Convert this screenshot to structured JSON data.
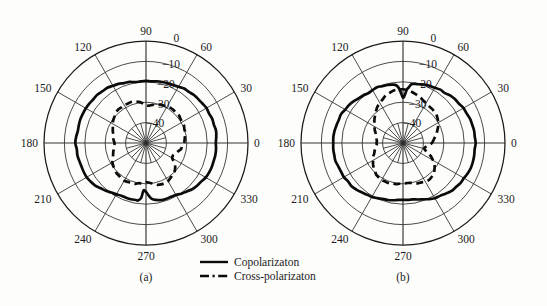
{
  "figure": {
    "background": "#fdfdfb",
    "ink": "#0b0b0b",
    "panels": [
      {
        "id": "a",
        "label": "(a)",
        "cx": 146,
        "cy": 143,
        "r": 102
      },
      {
        "id": "b",
        "label": "(b)",
        "cx": 403,
        "cy": 143,
        "r": 102
      }
    ]
  },
  "legend": {
    "items": [
      {
        "label": "Copolarizaton",
        "style": "solid"
      },
      {
        "label": "Cross-polarizaton",
        "style": "dashed"
      }
    ]
  },
  "chart_data": {
    "type": "line",
    "subtype": "polar-radiation-pattern",
    "title": "",
    "xlabel": "",
    "ylabel": "",
    "grid": true,
    "legend_position": "bottom-center",
    "angular_axis": {
      "unit": "degrees",
      "direction": "counterclockwise",
      "zero_at": "east",
      "tick_labels": [
        "0",
        "30",
        "60",
        "90",
        "120",
        "150",
        "180",
        "210",
        "240",
        "270",
        "300",
        "330"
      ],
      "tick_values": [
        0,
        30,
        60,
        90,
        120,
        150,
        180,
        210,
        240,
        270,
        300,
        330
      ]
    },
    "radial_axis": {
      "unit": "dB",
      "rlim": [
        -50,
        0
      ],
      "tick_labels": [
        "0",
        "-10",
        "-20",
        "-30",
        "-40"
      ],
      "tick_values": [
        0,
        -10,
        -20,
        -30,
        -40
      ],
      "label_angle_deg": 75,
      "n_rings": 5
    },
    "panels": [
      {
        "name": "(a)",
        "series": [
          {
            "name": "Copolarizaton",
            "style": "solid",
            "angles": [
              0,
              5,
              10,
              15,
              20,
              25,
              30,
              35,
              40,
              45,
              50,
              55,
              60,
              65,
              70,
              75,
              80,
              85,
              90,
              95,
              100,
              105,
              110,
              115,
              120,
              125,
              130,
              135,
              140,
              145,
              150,
              155,
              160,
              165,
              170,
              175,
              180,
              185,
              190,
              195,
              200,
              205,
              210,
              215,
              220,
              225,
              230,
              235,
              240,
              245,
              250,
              255,
              260,
              262,
              265,
              267,
              270,
              273,
              276,
              280,
              285,
              290,
              295,
              300,
              305,
              310,
              315,
              320,
              325,
              330,
              335,
              340,
              345,
              350,
              355
            ],
            "values": [
              -15.5,
              -15.4,
              -15.4,
              -15.5,
              -15.6,
              -15.8,
              -16.0,
              -16.3,
              -16.6,
              -16.9,
              -17.2,
              -17.6,
              -18.0,
              -18.4,
              -18.8,
              -19.1,
              -19.4,
              -19.6,
              -19.7,
              -19.8,
              -19.6,
              -19.2,
              -18.6,
              -18.0,
              -17.5,
              -17.1,
              -16.8,
              -16.6,
              -16.4,
              -16.3,
              -16.2,
              -16.1,
              -16.0,
              -15.9,
              -15.8,
              -15.7,
              -15.6,
              -15.7,
              -15.9,
              -16.2,
              -16.4,
              -16.4,
              -16.3,
              -16.8,
              -17.6,
              -18.6,
              -19.6,
              -20.4,
              -21.0,
              -21.4,
              -21.6,
              -21.7,
              -21.7,
              -21.6,
              -23.0,
              -26.5,
              -26.0,
              -24.0,
              -22.4,
              -21.6,
              -21.2,
              -21.0,
              -20.8,
              -20.4,
              -19.8,
              -19.0,
              -18.2,
              -17.5,
              -16.9,
              -16.4,
              -16.1,
              -15.9,
              -15.7,
              -15.6,
              -15.5
            ]
          },
          {
            "name": "Cross-polarizaton",
            "style": "dashed",
            "angles": [
              0,
              5,
              10,
              15,
              20,
              25,
              30,
              35,
              40,
              45,
              50,
              55,
              60,
              65,
              70,
              75,
              80,
              85,
              90,
              95,
              100,
              105,
              110,
              115,
              120,
              125,
              130,
              135,
              140,
              145,
              150,
              155,
              160,
              165,
              170,
              175,
              180,
              185,
              190,
              195,
              200,
              205,
              210,
              215,
              220,
              225,
              230,
              235,
              240,
              245,
              250,
              255,
              260,
              265,
              270,
              275,
              280,
              285,
              290,
              295,
              300,
              305,
              310,
              315,
              320,
              325,
              330,
              335,
              340,
              345,
              350,
              355
            ],
            "values": [
              -31.5,
              -31.0,
              -30.6,
              -30.2,
              -29.9,
              -29.6,
              -29.4,
              -29.2,
              -29.0,
              -28.9,
              -28.9,
              -29.0,
              -29.2,
              -29.5,
              -30.0,
              -30.6,
              -31.2,
              -31.8,
              -31.5,
              -30.6,
              -29.7,
              -29.1,
              -28.8,
              -28.6,
              -28.5,
              -28.6,
              -28.8,
              -29.2,
              -29.8,
              -30.5,
              -31.3,
              -32.1,
              -32.8,
              -33.4,
              -33.9,
              -34.2,
              -34.4,
              -34.3,
              -34.0,
              -33.5,
              -32.8,
              -32.0,
              -31.2,
              -30.5,
              -29.9,
              -29.4,
              -29.1,
              -28.9,
              -28.8,
              -28.9,
              -29.1,
              -29.4,
              -29.8,
              -30.3,
              -30.8,
              -30.4,
              -29.6,
              -28.9,
              -28.5,
              -28.4,
              -28.6,
              -29.0,
              -29.6,
              -30.4,
              -31.4,
              -33.0,
              -35.0,
              -35.6,
              -34.6,
              -33.6,
              -32.8,
              -32.1
            ]
          }
        ]
      },
      {
        "name": "(b)",
        "series": [
          {
            "name": "Copolarizaton",
            "style": "solid",
            "angles": [
              0,
              5,
              10,
              15,
              20,
              25,
              30,
              35,
              40,
              45,
              50,
              55,
              60,
              65,
              70,
              75,
              78,
              80,
              82,
              84,
              86,
              88,
              90,
              92,
              94,
              96,
              98,
              100,
              105,
              110,
              115,
              120,
              125,
              130,
              135,
              140,
              145,
              150,
              155,
              160,
              165,
              170,
              175,
              180,
              185,
              190,
              195,
              200,
              205,
              210,
              215,
              220,
              225,
              230,
              235,
              240,
              245,
              250,
              255,
              260,
              265,
              270,
              275,
              280,
              285,
              290,
              295,
              300,
              305,
              310,
              315,
              320,
              325,
              330,
              335,
              340,
              345,
              350,
              355
            ],
            "values": [
              -14.6,
              -14.6,
              -14.7,
              -14.9,
              -15.2,
              -15.5,
              -15.9,
              -16.3,
              -16.8,
              -17.3,
              -17.8,
              -18.3,
              -18.8,
              -19.2,
              -19.6,
              -20.0,
              -20.3,
              -20.6,
              -21.2,
              -22.3,
              -24.0,
              -26.4,
              -27.6,
              -25.6,
              -23.4,
              -22.0,
              -21.2,
              -20.8,
              -20.4,
              -20.2,
              -20.1,
              -20.1,
              -20.0,
              -19.6,
              -19.0,
              -18.4,
              -17.8,
              -17.2,
              -16.7,
              -16.3,
              -16.0,
              -15.8,
              -15.7,
              -15.6,
              -15.7,
              -15.8,
              -16.0,
              -16.2,
              -16.4,
              -16.6,
              -16.9,
              -17.3,
              -17.8,
              -18.4,
              -19.0,
              -19.6,
              -20.2,
              -20.8,
              -21.3,
              -21.7,
              -22.0,
              -22.1,
              -22.0,
              -21.7,
              -21.2,
              -20.5,
              -19.7,
              -18.9,
              -18.1,
              -17.4,
              -16.8,
              -16.2,
              -15.7,
              -15.3,
              -15.0,
              -14.8,
              -14.7,
              -14.6,
              -14.6
            ]
          },
          {
            "name": "Cross-polarizaton",
            "style": "dashed",
            "angles": [
              0,
              5,
              10,
              15,
              20,
              25,
              30,
              35,
              40,
              45,
              50,
              55,
              60,
              65,
              70,
              75,
              80,
              85,
              90,
              95,
              100,
              105,
              110,
              115,
              120,
              125,
              130,
              135,
              140,
              145,
              150,
              155,
              160,
              165,
              170,
              175,
              180,
              185,
              190,
              195,
              200,
              205,
              210,
              215,
              220,
              225,
              230,
              235,
              240,
              245,
              250,
              255,
              260,
              265,
              270,
              275,
              280,
              285,
              290,
              295,
              300,
              305,
              310,
              315,
              320,
              325,
              330,
              335,
              340,
              345,
              350,
              355
            ],
            "values": [
              -36.0,
              -35.2,
              -34.2,
              -33.1,
              -32.0,
              -31.0,
              -30.1,
              -29.4,
              -28.8,
              -28.4,
              -28.0,
              -27.7,
              -27.3,
              -26.8,
              -26.2,
              -25.5,
              -24.8,
              -24.2,
              -23.8,
              -23.7,
              -23.9,
              -24.4,
              -25.2,
              -26.2,
              -27.3,
              -28.4,
              -29.5,
              -30.6,
              -31.7,
              -32.8,
              -33.8,
              -34.8,
              -35.6,
              -36.3,
              -36.8,
              -37.1,
              -37.2,
              -37.0,
              -36.5,
              -35.8,
              -35.0,
              -34.0,
              -33.0,
              -32.0,
              -31.1,
              -30.4,
              -29.8,
              -29.4,
              -29.2,
              -29.1,
              -29.2,
              -29.4,
              -29.7,
              -30.0,
              -30.3,
              -30.4,
              -30.2,
              -29.8,
              -29.2,
              -28.6,
              -28.2,
              -28.0,
              -28.2,
              -28.8,
              -29.8,
              -31.2,
              -33.0,
              -35.2,
              -37.6,
              -39.2,
              -38.8,
              -37.4
            ]
          }
        ]
      }
    ]
  }
}
